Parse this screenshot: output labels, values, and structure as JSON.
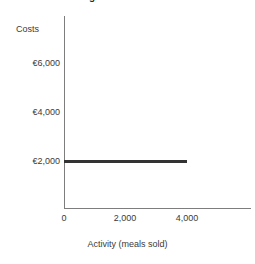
{
  "chart_data": {
    "type": "line",
    "title": "Figure: Fixed costs",
    "xlabel": "Activity (meals sold)",
    "ylabel": "Costs",
    "xlim": [
      0,
      5300
    ],
    "ylim": [
      0,
      6900
    ],
    "grid": false,
    "legend": false,
    "xticks": [
      {
        "value": 0,
        "label": "0"
      },
      {
        "value": 2000,
        "label": "2,000"
      },
      {
        "value": 4000,
        "label": "4,000"
      }
    ],
    "yticks": [
      {
        "value": 6000,
        "label": "€6,000"
      },
      {
        "value": 4000,
        "label": "€4,000"
      },
      {
        "value": 2000,
        "label": "€2,000"
      }
    ],
    "series": [
      {
        "name": "Fixed costs",
        "color": "#333333",
        "x": [
          0,
          4000
        ],
        "values": [
          2000,
          2000
        ]
      }
    ]
  },
  "axis_color": "#7d7d7d"
}
